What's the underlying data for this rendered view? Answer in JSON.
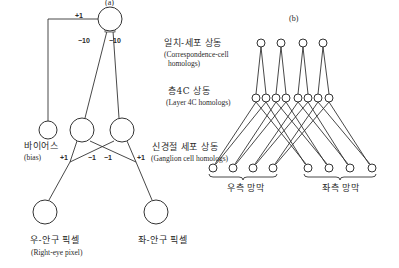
{
  "panel_a": {
    "label": "(a)",
    "bias": {
      "ko": "바이어스",
      "en": "(bias)"
    },
    "right_eye": {
      "ko": "우-안구 픽셀",
      "en": "(Right-eye pixel)"
    },
    "left_eye": {
      "ko": "좌-안구 픽셀"
    },
    "weights": {
      "bias_to_top": "+1",
      "left_to_top": "−10",
      "right_to_top": "−10",
      "right_eye_to_left": "+1",
      "left_eye_to_left": "−1",
      "right_eye_to_right": "−1",
      "left_eye_to_right": "+1"
    },
    "nodes": [
      {
        "id": "top",
        "cx": 110,
        "cy": 19,
        "r": 12
      },
      {
        "id": "bias",
        "cx": 48,
        "cy": 130,
        "r": 9
      },
      {
        "id": "mid_left",
        "cx": 82,
        "cy": 130,
        "r": 12
      },
      {
        "id": "mid_right",
        "cx": 122,
        "cy": 130,
        "r": 12
      },
      {
        "id": "right_eye",
        "cx": 45,
        "cy": 212,
        "r": 12
      },
      {
        "id": "left_eye",
        "cx": 156,
        "cy": 212,
        "r": 12
      }
    ]
  },
  "panel_b": {
    "label": "(b)",
    "correspondence": {
      "ko": "일치-세포 상동",
      "en1": "(Correspondence-cell",
      "en2": "homologs)"
    },
    "layer4c": {
      "ko": "층4C 상동",
      "en": "(Layer 4C homologs)"
    },
    "ganglion": {
      "ko": "신경절 세포 상동",
      "en": "(Ganglion cell homologs)"
    },
    "right_retina": "우측 망막",
    "left_retina": "좌측 망막",
    "top_nodes_x": [
      261,
      281,
      303,
      323
    ],
    "top_y": 43,
    "mid_nodes_x": [
      256,
      266,
      276,
      286,
      298,
      308,
      318,
      329
    ],
    "mid_y": 98,
    "bottom_nodes_x": [
      213,
      233,
      253,
      273,
      308,
      329,
      350,
      372
    ],
    "bottom_y": 168
  }
}
